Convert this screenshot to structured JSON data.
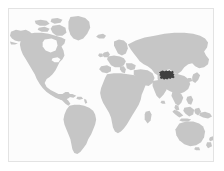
{
  "figure": {
    "kind": "world-locator-map",
    "width_px": 224,
    "height_px": 171,
    "title": "",
    "caption": "",
    "labels": [],
    "legend": []
  },
  "colors": {
    "page_background": "#ffffff",
    "map_background": "#fcfcfc",
    "frame_border": "#e3e3e3",
    "land": "#c6c6c6",
    "highlight": "#404040",
    "ocean": "#fcfcfc"
  },
  "map": {
    "projection": "equirectangular",
    "lon_range": [
      -180,
      180
    ],
    "lat_range": [
      -60,
      84
    ],
    "frame": {
      "left": 8,
      "top": 8,
      "width": 206,
      "height": 154,
      "border_width": 1
    },
    "graticule": false,
    "coastline_stroke": false
  },
  "regions": [
    {
      "id": "north-america",
      "name": "North America",
      "fill_role": "land"
    },
    {
      "id": "greenland",
      "name": "Greenland",
      "fill_role": "land"
    },
    {
      "id": "canadian-arctic",
      "name": "Canadian Arctic Archipelago",
      "fill_role": "land"
    },
    {
      "id": "central-america",
      "name": "Central America",
      "fill_role": "land"
    },
    {
      "id": "caribbean",
      "name": "Caribbean Islands",
      "fill_role": "land"
    },
    {
      "id": "south-america",
      "name": "South America",
      "fill_role": "land"
    },
    {
      "id": "europe",
      "name": "Europe",
      "fill_role": "land"
    },
    {
      "id": "british-isles",
      "name": "British Isles",
      "fill_role": "land"
    },
    {
      "id": "scandinavia",
      "name": "Scandinavia",
      "fill_role": "land"
    },
    {
      "id": "africa",
      "name": "Africa",
      "fill_role": "land"
    },
    {
      "id": "madagascar",
      "name": "Madagascar",
      "fill_role": "land"
    },
    {
      "id": "middle-east",
      "name": "Middle East",
      "fill_role": "land"
    },
    {
      "id": "russia-asia",
      "name": "Russia and Asia",
      "fill_role": "land"
    },
    {
      "id": "india",
      "name": "Indian Subcontinent",
      "fill_role": "land"
    },
    {
      "id": "sri-lanka",
      "name": "Sri Lanka",
      "fill_role": "land"
    },
    {
      "id": "southeast-asia",
      "name": "Southeast Asia",
      "fill_role": "land"
    },
    {
      "id": "japan",
      "name": "Japan",
      "fill_role": "land"
    },
    {
      "id": "indonesia",
      "name": "Indonesian Archipelago",
      "fill_role": "land"
    },
    {
      "id": "philippines",
      "name": "Philippines",
      "fill_role": "land"
    },
    {
      "id": "new-guinea",
      "name": "New Guinea",
      "fill_role": "land"
    },
    {
      "id": "australia",
      "name": "Australia",
      "fill_role": "land"
    },
    {
      "id": "new-zealand",
      "name": "New Zealand",
      "fill_role": "land"
    },
    {
      "id": "iceland",
      "name": "Iceland",
      "fill_role": "land"
    },
    {
      "id": "highlighted-region",
      "name": "Highlighted region (central China)",
      "fill_role": "highlight",
      "approx_center_px": [
        166,
        77
      ],
      "approx_size_px": [
        13,
        11
      ]
    }
  ],
  "chart_data": {
    "type": "map",
    "title": "",
    "projection": "equirectangular",
    "xlabel": "Longitude",
    "ylabel": "Latitude",
    "xlim": [
      -180,
      180
    ],
    "ylim": [
      -60,
      84
    ],
    "grid": false,
    "legend_position": "none",
    "series": [
      {
        "name": "Land",
        "color": "#c6c6c6",
        "values": 1,
        "description": "All continental landmasses rendered in uniform light grey"
      },
      {
        "name": "Highlighted region",
        "color": "#404040",
        "values": 1,
        "description": "Single small highlighted administrative region in central / south-western China (approx. 100-110 E, 26-33 N)",
        "approx_lon_lat": [
          105,
          30
        ]
      }
    ],
    "annotations": []
  }
}
